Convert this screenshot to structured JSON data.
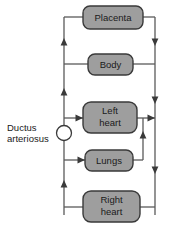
{
  "diagram": {
    "colors": {
      "node_fill": "#9e9e9e",
      "node_stroke": "#3a3a3a",
      "line": "#5a5a5a",
      "background": "#ffffff",
      "text": "#1a1a1a"
    },
    "nodes": [
      {
        "id": "placenta",
        "label": "Placenta",
        "line1": "Placenta",
        "line2": ""
      },
      {
        "id": "body",
        "label": "Body",
        "line1": "Body",
        "line2": ""
      },
      {
        "id": "left-heart",
        "label": "Left heart",
        "line1": "Left",
        "line2": "heart"
      },
      {
        "id": "lungs",
        "label": "Lungs",
        "line1": "Lungs",
        "line2": ""
      },
      {
        "id": "right-heart",
        "label": "Right heart",
        "line1": "Right",
        "line2": "heart"
      }
    ],
    "annotations": [
      {
        "id": "ductus-arteriosus",
        "line1": "Ductus",
        "line2": "arteriosus"
      }
    ],
    "edges": [
      {
        "from": "right-heart",
        "to": "placenta",
        "via": "right-rail"
      },
      {
        "from": "placenta",
        "to": "left-rail",
        "via": "top-left"
      },
      {
        "from": "left-rail",
        "to": "body",
        "via": "body-in"
      },
      {
        "from": "body",
        "to": "right-rail",
        "via": "body-out"
      },
      {
        "from": "left-rail",
        "to": "left-heart",
        "via": "left-heart-in"
      },
      {
        "from": "left-heart",
        "to": "right-rail",
        "via": "left-heart-out"
      },
      {
        "from": "left-rail",
        "to": "lungs",
        "via": "lungs-in"
      },
      {
        "from": "lungs",
        "to": "left-heart",
        "via": "lungs-to-left-heart"
      },
      {
        "from": "right-rail",
        "to": "right-heart",
        "via": "right-heart-in"
      },
      {
        "from": "right-heart",
        "to": "left-rail",
        "via": "right-heart-out"
      }
    ]
  }
}
